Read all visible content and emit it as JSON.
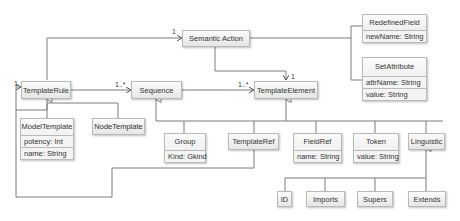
{
  "diagram": {
    "type": "UML class diagram",
    "classes": {
      "semantic_action": {
        "name": "Semantic Action"
      },
      "redefined_field": {
        "name": "RedefinedField",
        "attrs": [
          "newName: String"
        ]
      },
      "set_attribute": {
        "name": "SetAttribute",
        "attrs": [
          "attrName: String",
          "value: String"
        ]
      },
      "template_rule": {
        "name": "TemplateRule"
      },
      "sequence": {
        "name": "Sequence"
      },
      "template_element": {
        "name": "TemplateElement"
      },
      "model_template": {
        "name": "ModelTemplate",
        "attrs": [
          "potency: Int",
          "name: String"
        ]
      },
      "node_template": {
        "name": "NodeTemplate"
      },
      "group": {
        "name": "Group",
        "attrs": [
          "Kind: Gkind"
        ]
      },
      "template_ref": {
        "name": "TemplateRef"
      },
      "field_ref": {
        "name": "FieldRef",
        "attrs": [
          "name: String"
        ]
      },
      "token": {
        "name": "Token",
        "attrs": [
          "value: String"
        ]
      },
      "linguistic": {
        "name": "Linguistic"
      },
      "id": {
        "name": "ID"
      },
      "imports": {
        "name": "Imports"
      },
      "supers": {
        "name": "Supers"
      },
      "extends": {
        "name": "Extends"
      }
    },
    "multiplicities": {
      "rule_to_action": "1",
      "rule_self": "1",
      "rule_to_sequence": "1..*",
      "sequence_to_element": "1..*",
      "action_to_element": "1"
    },
    "colors": {
      "line": "#7a7a7a",
      "box_border": "#b9b9b9",
      "box_fill_top": "#fbfbfb",
      "box_fill_bottom": "#e6e6e6"
    }
  }
}
